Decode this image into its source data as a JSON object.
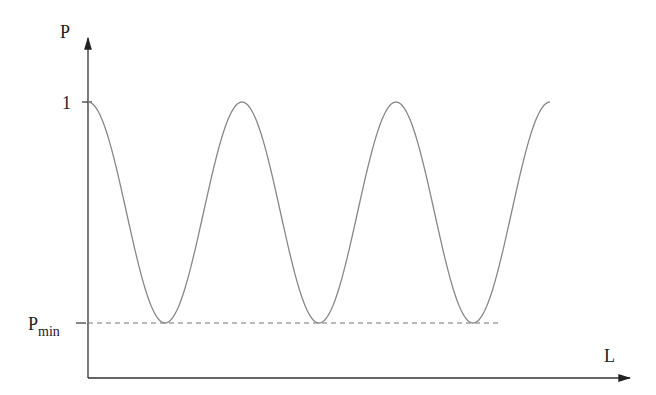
{
  "chart_data": {
    "type": "line",
    "title": "",
    "xlabel": "L",
    "ylabel": "P",
    "y_ticks": [
      {
        "label": "1",
        "value": 1
      },
      {
        "label": "P",
        "subscript": "min",
        "value": "P_min"
      }
    ],
    "x_ticks": [],
    "grid": false,
    "legend": null,
    "series": [
      {
        "name": "P(L)",
        "description": "cosine oscillation between 1 and P_min, starting at maximum, 3 full periods",
        "x": [
          0,
          0.5,
          1,
          1.5,
          2,
          2.5,
          3
        ],
        "y": [
          1,
          "P_min",
          1,
          "P_min",
          1,
          "P_min",
          1
        ]
      }
    ],
    "reference_lines": [
      {
        "orientation": "horizontal",
        "value": "P_min",
        "style": "dashed"
      }
    ],
    "colors": {
      "curve": "#888888",
      "axes": "#333333",
      "dashed": "#777777"
    }
  }
}
